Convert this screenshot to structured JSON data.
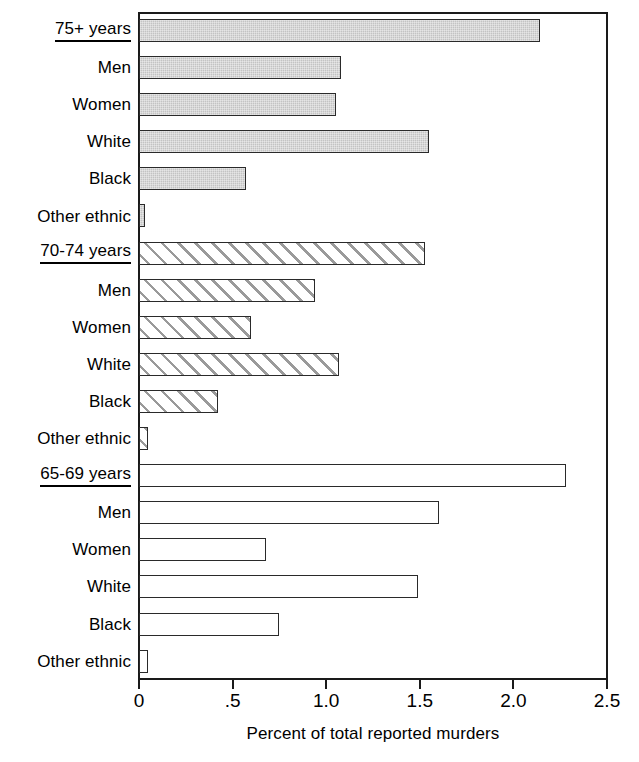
{
  "chart_data": {
    "type": "bar",
    "orientation": "horizontal",
    "title": "",
    "xlabel": "Percent of total reported murders",
    "ylabel": "",
    "xlim": [
      0,
      2.5
    ],
    "xticks": [
      0,
      0.5,
      1.0,
      1.5,
      2.0,
      2.5
    ],
    "xtick_labels": [
      "0",
      ".5",
      "1.0",
      "1.5",
      "2.0",
      "2.5"
    ],
    "grid": false,
    "legend": false,
    "categories": [
      "75+ years",
      "Men",
      "Women",
      "White",
      "Black",
      "Other ethnic",
      "70-74 years",
      "Men",
      "Women",
      "White",
      "Black",
      "Other ethnic",
      "65-69 years",
      "Men",
      "Women",
      "White",
      "Black",
      "Other ethnic"
    ],
    "values": [
      2.14,
      1.08,
      1.05,
      1.55,
      0.57,
      0.03,
      1.53,
      0.94,
      0.6,
      1.07,
      0.42,
      0.05,
      2.28,
      1.6,
      0.68,
      1.49,
      0.75,
      0.05
    ],
    "groups": [
      {
        "name": "75+ years",
        "fill": "solid-gray",
        "rows": [
          {
            "label": "75+ years",
            "value": 2.14,
            "is_group_head": true
          },
          {
            "label": "Men",
            "value": 1.08,
            "is_group_head": false
          },
          {
            "label": "Women",
            "value": 1.05,
            "is_group_head": false
          },
          {
            "label": "White",
            "value": 1.55,
            "is_group_head": false
          },
          {
            "label": "Black",
            "value": 0.57,
            "is_group_head": false
          },
          {
            "label": "Other ethnic",
            "value": 0.03,
            "is_group_head": false
          }
        ]
      },
      {
        "name": "70-74 years",
        "fill": "diagonal-hatch",
        "rows": [
          {
            "label": "70-74 years",
            "value": 1.53,
            "is_group_head": true
          },
          {
            "label": "Men",
            "value": 0.94,
            "is_group_head": false
          },
          {
            "label": "Women",
            "value": 0.6,
            "is_group_head": false
          },
          {
            "label": "White",
            "value": 1.07,
            "is_group_head": false
          },
          {
            "label": "Black",
            "value": 0.42,
            "is_group_head": false
          },
          {
            "label": "Other ethnic",
            "value": 0.05,
            "is_group_head": false
          }
        ]
      },
      {
        "name": "65-69 years",
        "fill": "white-open",
        "rows": [
          {
            "label": "65-69 years",
            "value": 2.28,
            "is_group_head": true
          },
          {
            "label": "Men",
            "value": 1.6,
            "is_group_head": false
          },
          {
            "label": "Women",
            "value": 0.68,
            "is_group_head": false
          },
          {
            "label": "White",
            "value": 1.49,
            "is_group_head": false
          },
          {
            "label": "Black",
            "value": 0.75,
            "is_group_head": false
          },
          {
            "label": "Other ethnic",
            "value": 0.05,
            "is_group_head": false
          }
        ]
      }
    ],
    "colors": {
      "bar_solid": "#c3c3c3",
      "bar_hatch_line": "#9a9a9a",
      "bar_open": "#ffffff",
      "bar_border": "#2a2a2a",
      "axis": "#1a1a1a",
      "text": "#000000",
      "background": "#ffffff"
    }
  }
}
